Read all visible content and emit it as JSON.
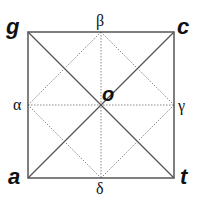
{
  "diagram": {
    "type": "geometric-square-with-diagonals",
    "square": {
      "corners": {
        "top_left": "g",
        "top_right": "c",
        "bottom_left": "a",
        "bottom_right": "t"
      }
    },
    "midpoints": {
      "top": "β",
      "left": "α",
      "right": "γ",
      "bottom": "δ"
    },
    "center": "o",
    "lines": {
      "solid": [
        "g-c",
        "c-t",
        "t-a",
        "a-g",
        "g-t",
        "a-c"
      ],
      "dotted": [
        "β-δ",
        "α-γ",
        "β-γ",
        "γ-δ",
        "δ-α",
        "α-β"
      ]
    },
    "colors": {
      "solid_line": "#555555",
      "dotted_line": "#888888",
      "text": "#111111"
    }
  }
}
